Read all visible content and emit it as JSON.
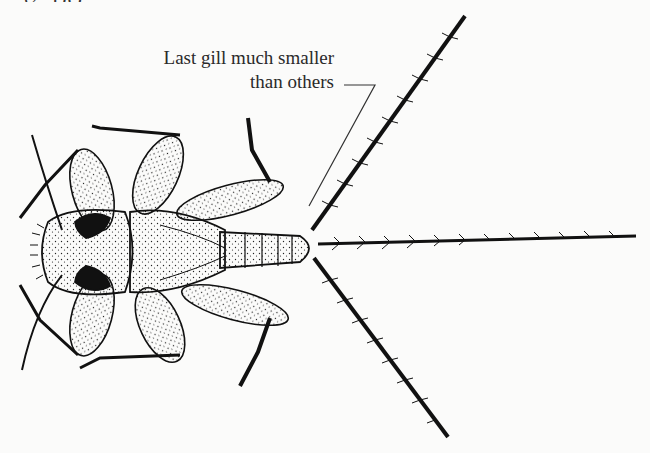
{
  "figure": {
    "heading_fragment": "32. DO",
    "callout": {
      "line1": "Last gill much smaller",
      "line2": "than others"
    },
    "colors": {
      "ink": "#111111",
      "paper": "#fbfbfa",
      "text": "#2a2a2a"
    }
  }
}
